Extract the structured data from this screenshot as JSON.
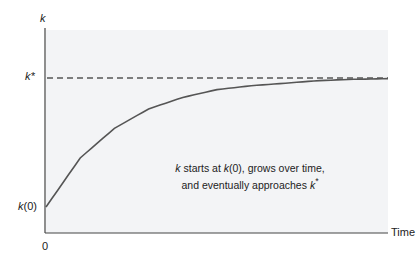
{
  "chart_data": {
    "type": "line",
    "title": "",
    "xlabel": "Time",
    "ylabel": "k",
    "x_ticks": [
      "0"
    ],
    "y_ticks": [
      "k(0)",
      "k*"
    ],
    "grid": false,
    "legend": null,
    "background_color": "#f3f4f6",
    "series": [
      {
        "name": "k(t)",
        "style": "solid",
        "color": "#555555",
        "x": [
          0,
          0.1,
          0.2,
          0.3,
          0.4,
          0.5,
          0.6,
          0.7,
          0.8,
          0.9,
          1.0
        ],
        "y": [
          0.0,
          0.38,
          0.61,
          0.76,
          0.85,
          0.91,
          0.94,
          0.96,
          0.98,
          0.99,
          0.995
        ]
      },
      {
        "name": "k*",
        "style": "dashed",
        "color": "#555555",
        "x": [
          0,
          1.0
        ],
        "y": [
          1.0,
          1.0
        ]
      }
    ],
    "value_scale_note": "y normalized: 0 = k(0), 1 = k*",
    "annotation": {
      "line1": "k starts at k(0), grows over time,",
      "line2": "and eventually approaches k*"
    }
  },
  "labels": {
    "y_axis": "k",
    "k_star": "k*",
    "k_zero": "k(0)",
    "x_origin": "0",
    "x_axis": "Time",
    "annot_k": "k",
    "annot_mid1": " starts at ",
    "annot_k0": "k",
    "annot_mid2": "(0), grows over time,",
    "annot_line2": "and eventually approaches ",
    "annot_kstar": "k",
    "annot_star": "*"
  }
}
